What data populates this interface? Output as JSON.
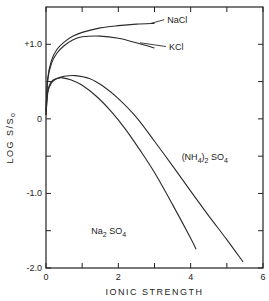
{
  "chart_data": {
    "type": "line",
    "title": "",
    "xlabel": "IONIC STRENGTH",
    "ylabel": "LOG S/S0",
    "ylabel_main": "LOG S/S",
    "ylabel_sub": "o",
    "xlim": [
      0,
      6
    ],
    "ylim": [
      -2.0,
      1.5
    ],
    "x_ticks": [
      0,
      1,
      2,
      3,
      4,
      5,
      6
    ],
    "x_tick_labels": [
      {
        "value": 0,
        "label": "0"
      },
      {
        "value": 2,
        "label": "2"
      },
      {
        "value": 4,
        "label": "4"
      },
      {
        "value": 6,
        "label": "6"
      }
    ],
    "y_ticks": [
      -2.0,
      -1.5,
      -1.0,
      -0.5,
      0,
      0.5,
      1.0
    ],
    "y_tick_labels": [
      {
        "value": 1.0,
        "label": "+1.0"
      },
      {
        "value": 0,
        "label": "0"
      },
      {
        "value": -1.0,
        "label": "-1.0"
      },
      {
        "value": -2.0,
        "label": "-2.0"
      }
    ],
    "grid": false,
    "series": [
      {
        "name": "NaCl",
        "label_parts": [
          {
            "t": "NaCl"
          }
        ],
        "label_pos": {
          "x": 3.35,
          "y": 1.29
        },
        "leader_from": {
          "x": 2.9,
          "y": 1.28
        },
        "x": [
          0,
          0.05,
          0.15,
          0.3,
          0.5,
          0.75,
          1.0,
          1.5,
          2.0,
          2.5,
          3.0
        ],
        "y": [
          0.1,
          0.55,
          0.78,
          0.93,
          1.03,
          1.11,
          1.16,
          1.22,
          1.25,
          1.27,
          1.28
        ]
      },
      {
        "name": "KCl",
        "label_parts": [
          {
            "t": "KCl"
          }
        ],
        "label_pos": {
          "x": 3.4,
          "y": 0.93
        },
        "leader_from": {
          "x": 2.6,
          "y": 1.02
        },
        "x": [
          0,
          0.05,
          0.15,
          0.3,
          0.5,
          0.75,
          1.0,
          1.5,
          2.0,
          2.5,
          3.0
        ],
        "y": [
          0.1,
          0.53,
          0.74,
          0.88,
          0.98,
          1.06,
          1.1,
          1.11,
          1.08,
          1.02,
          0.95
        ]
      },
      {
        "name": "(NH4)2SO4",
        "label_parts": [
          {
            "t": "(NH"
          },
          {
            "t": "4",
            "sub": true
          },
          {
            "t": ")"
          },
          {
            "t": "2",
            "sub": true
          },
          {
            "t": " SO"
          },
          {
            "t": "4",
            "sub": true
          }
        ],
        "label_pos": {
          "x": 3.75,
          "y": -0.55
        },
        "x": [
          0,
          0.05,
          0.15,
          0.3,
          0.5,
          0.8,
          1.2,
          1.6,
          2.0,
          2.5,
          3.0,
          3.5,
          4.0,
          4.5,
          5.0,
          5.45
        ],
        "y": [
          0.05,
          0.35,
          0.48,
          0.54,
          0.57,
          0.58,
          0.54,
          0.43,
          0.27,
          0.02,
          -0.3,
          -0.63,
          -0.97,
          -1.3,
          -1.62,
          -1.92
        ],
        "color": "#2a2a2a"
      },
      {
        "name": "Na2SO4",
        "label_parts": [
          {
            "t": "Na"
          },
          {
            "t": "2",
            "sub": true
          },
          {
            "t": " SO"
          },
          {
            "t": "4",
            "sub": true
          }
        ],
        "label_pos": {
          "x": 1.25,
          "y": -1.55
        },
        "x": [
          0,
          0.05,
          0.15,
          0.3,
          0.45,
          0.7,
          1.0,
          1.4,
          1.8,
          2.2,
          2.6,
          3.0,
          3.5,
          4.0,
          4.15
        ],
        "y": [
          0.05,
          0.38,
          0.5,
          0.54,
          0.55,
          0.52,
          0.45,
          0.3,
          0.1,
          -0.14,
          -0.42,
          -0.72,
          -1.15,
          -1.6,
          -1.75
        ],
        "color": "#2a2a2a"
      }
    ]
  }
}
